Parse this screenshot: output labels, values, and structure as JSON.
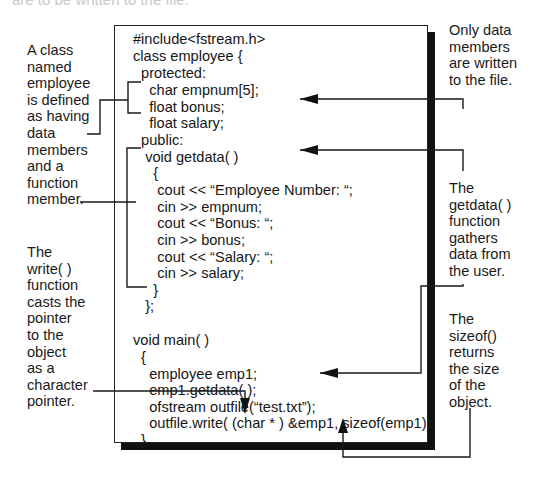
{
  "header": {
    "faded_caption": "are to be written to the file."
  },
  "code": {
    "lines": [
      "#include<fstream.h>",
      "class employee {",
      "  protected:",
      "    char empnum[5];",
      "    float bonus;",
      "    float salary;",
      "  public:",
      "   void getdata( )",
      "     {",
      "      cout << “Employee Number: “;",
      "      cin >> empnum;",
      "      cout << “Bonus: “;",
      "      cin >> bonus;",
      "      cout << “Salary: “;",
      "      cin >> salary;",
      "     }",
      "   };",
      "",
      "void main( )",
      "  {",
      "    employee emp1;",
      "    emp1.getdata( );",
      "    ofstream outfile(“test.txt”);",
      "    outfile.write( (char * ) &emp1, sizeof(emp1));",
      "  }"
    ]
  },
  "annotations": {
    "class_definition": "A class\nnamed\nemployee\nis defined\nas having\ndata\nmembers\nand a\nfunction\nmember.",
    "write_function": "The\nwrite( )\nfunction\ncasts the\npointer\nto the\nobject\nas a\ncharacter\npointer.",
    "data_members_only": "Only data\nmembers\nare written\nto the file.",
    "getdata_function": "The\ngetdata( )\nfunction\ngathers\ndata from\nthe user.",
    "sizeof_operator": "The\nsizeof()\nreturns\nthe size\nof the\nobject."
  },
  "colors": {
    "line": "#1a1a1a",
    "shadow": "#111111",
    "background": "#ffffff"
  }
}
